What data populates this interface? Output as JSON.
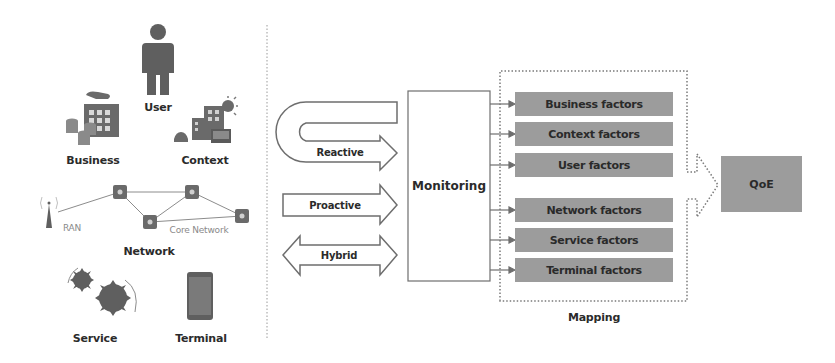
{
  "left_panel": {
    "sources": {
      "user": "User",
      "business": "Business",
      "context": "Context",
      "network": "Network",
      "ran": "RAN",
      "core_network": "Core Network",
      "service": "Service",
      "terminal": "Terminal"
    },
    "icons": [
      "person-icon",
      "business-building-icon",
      "context-city-icon",
      "cell-tower-icon",
      "router-icon",
      "gears-icon",
      "smartphone-icon"
    ]
  },
  "approaches": {
    "reactive": "Reactive",
    "proactive": "Proactive",
    "hybrid": "Hybrid"
  },
  "monitoring": {
    "label": "Monitoring"
  },
  "mapping": {
    "label": "Mapping",
    "factors": [
      "Business factors",
      "Context factors",
      "User factors",
      "Network factors",
      "Service factors",
      "Terminal factors"
    ]
  },
  "output": {
    "label": "QoE"
  },
  "colors": {
    "box_fill": "#9c9c9c",
    "stroke": "#6e6e6e",
    "icon": "#5f5f5f",
    "text": "#2b2b2b"
  }
}
